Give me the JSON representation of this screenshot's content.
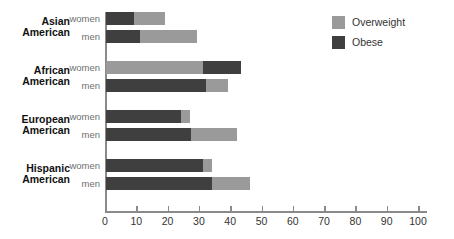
{
  "chart_data": {
    "type": "bar",
    "orientation": "horizontal",
    "stacked": true,
    "title": "",
    "subtitle": "",
    "xlabel": "",
    "ylabel": "",
    "xlim": [
      0,
      100
    ],
    "xticks": [
      0,
      10,
      20,
      30,
      40,
      50,
      60,
      70,
      80,
      90,
      100
    ],
    "xtick_labels": [
      "0",
      "10",
      "20",
      "30",
      "40",
      "50",
      "60",
      "70",
      "80",
      "90",
      "100"
    ],
    "grid": false,
    "legend_position": "top-right",
    "legend": [
      {
        "name": "Overweight",
        "color": "#9a9a9a"
      },
      {
        "name": "Obese",
        "color": "#3f3f3f"
      }
    ],
    "groups": [
      {
        "label_line1": "Asian",
        "label_line2": "American",
        "rows": [
          {
            "label": "women",
            "segment_order": [
              "Obese",
              "Overweight"
            ],
            "obese": 9,
            "overweight": 10,
            "total": 19
          },
          {
            "label": "men",
            "segment_order": [
              "Obese",
              "Overweight"
            ],
            "obese": 11,
            "overweight": 18,
            "total": 29
          }
        ]
      },
      {
        "label_line1": "African",
        "label_line2": "American",
        "rows": [
          {
            "label": "women",
            "segment_order": [
              "Overweight",
              "Obese"
            ],
            "overweight": 31,
            "obese": 12,
            "total": 43
          },
          {
            "label": "men",
            "segment_order": [
              "Obese",
              "Overweight"
            ],
            "obese": 32,
            "overweight": 7,
            "total": 39
          }
        ]
      },
      {
        "label_line1": "European",
        "label_line2": "American",
        "rows": [
          {
            "label": "women",
            "segment_order": [
              "Obese",
              "Overweight"
            ],
            "obese": 24,
            "overweight": 3,
            "total": 27
          },
          {
            "label": "men",
            "segment_order": [
              "Obese",
              "Overweight"
            ],
            "obese": 27,
            "overweight": 15,
            "total": 42
          }
        ]
      },
      {
        "label_line1": "Hispanic",
        "label_line2": "American",
        "rows": [
          {
            "label": "women",
            "segment_order": [
              "Obese",
              "Overweight"
            ],
            "obese": 31,
            "overweight": 3,
            "total": 34
          },
          {
            "label": "men",
            "segment_order": [
              "Obese",
              "Overweight"
            ],
            "obese": 34,
            "overweight": 12,
            "total": 46
          }
        ]
      }
    ]
  },
  "colors": {
    "overweight": "#9a9a9a",
    "obese": "#3f3f3f",
    "axis": "#8a8a8a",
    "text": "#333333",
    "group_label": "#111111",
    "series_label": "#6f6f6f",
    "background": "#ffffff"
  },
  "geometry": {
    "plot_left": 105,
    "plot_top": 12,
    "px_per_unit": 3.13,
    "bar_height": 13,
    "row_gap": 5,
    "group_gap": 18,
    "axis_length_units": 103
  }
}
